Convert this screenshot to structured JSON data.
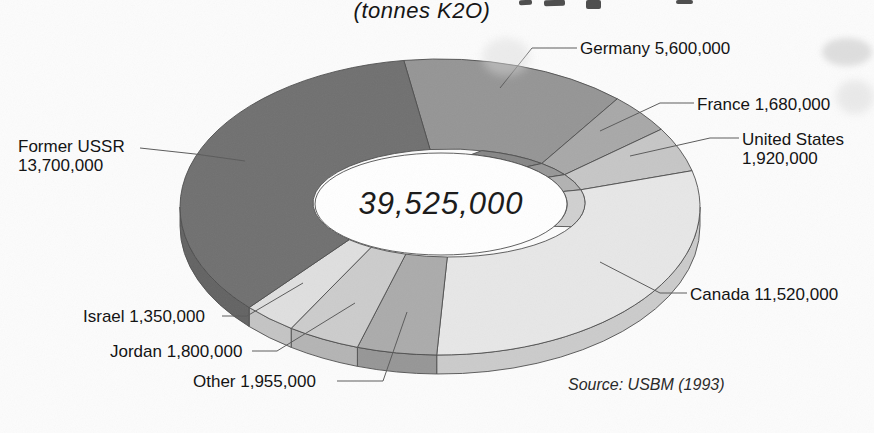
{
  "page": {
    "background": "#fcfcfc"
  },
  "chart_data": {
    "type": "pie",
    "subtype": "3d-donut",
    "title": "(tonnes K2O)",
    "center_total_label": "39,525,000",
    "total": 39525000,
    "source": "Source: USBM (1993)",
    "unit": "tonnes K2O",
    "segments": [
      {
        "name": "Germany",
        "value": 5600000,
        "label": "Germany 5,600,000",
        "color": "#959595"
      },
      {
        "name": "France",
        "value": 1680000,
        "label": "France 1,680,000",
        "color": "#a8a8a8"
      },
      {
        "name": "United States",
        "value": 1920000,
        "label": "United States 1,920,000",
        "color": "#c6c6c6"
      },
      {
        "name": "Canada",
        "value": 11520000,
        "label": "Canada 11,520,000",
        "color": "#e7e7e7"
      },
      {
        "name": "Other",
        "value": 1955000,
        "label": "Other 1,955,000",
        "color": "#ababab"
      },
      {
        "name": "Jordan",
        "value": 1800000,
        "label": "Jordan 1,800,000",
        "color": "#cccccc"
      },
      {
        "name": "Israel",
        "value": 1350000,
        "label": "Israel 1,350,000",
        "color": "#dfdfdf"
      },
      {
        "name": "Former USSR",
        "value": 13700000,
        "label": "Former USSR 13,700,000",
        "color": "#707070"
      }
    ],
    "labels": [
      {
        "lines": [
          "Germany 5,600,000"
        ],
        "x": 580,
        "y": 39,
        "leader": [
          [
            577,
            48
          ],
          [
            532,
            48
          ],
          [
            500,
            88
          ]
        ]
      },
      {
        "lines": [
          "France 1,680,000"
        ],
        "x": 697,
        "y": 95,
        "leader": [
          [
            694,
            103
          ],
          [
            660,
            103
          ],
          [
            600,
            131
          ]
        ]
      },
      {
        "lines": [
          "United States",
          "1,920,000"
        ],
        "x": 742,
        "y": 130,
        "leader": [
          [
            739,
            138
          ],
          [
            710,
            138
          ],
          [
            630,
            156
          ]
        ]
      },
      {
        "lines": [
          "Canada 11,520,000"
        ],
        "x": 690,
        "y": 285,
        "leader": [
          [
            687,
            293
          ],
          [
            660,
            293
          ],
          [
            600,
            262
          ]
        ]
      },
      {
        "lines": [
          "Other 1,955,000"
        ],
        "x": 193,
        "y": 372,
        "leader": [
          [
            337,
            381
          ],
          [
            383,
            381
          ],
          [
            407,
            312
          ]
        ]
      },
      {
        "lines": [
          "Jordan 1,800,000"
        ],
        "x": 110,
        "y": 342,
        "leader": [
          [
            252,
            351
          ],
          [
            277,
            351
          ],
          [
            355,
            303
          ]
        ]
      },
      {
        "lines": [
          "Israel 1,350,000"
        ],
        "x": 83,
        "y": 307,
        "leader": [
          [
            222,
            316
          ],
          [
            247,
            316
          ],
          [
            303,
            283
          ]
        ]
      },
      {
        "lines": [
          "Former USSR",
          "13,700,000"
        ],
        "x": 18,
        "y": 137,
        "leader": [
          [
            140,
            148
          ],
          [
            195,
            154
          ],
          [
            245,
            161
          ]
        ]
      }
    ],
    "layout": {
      "start_angle_deg": -8,
      "legend": "none",
      "label_style": "callout-leader-lines",
      "grid": "off"
    }
  }
}
